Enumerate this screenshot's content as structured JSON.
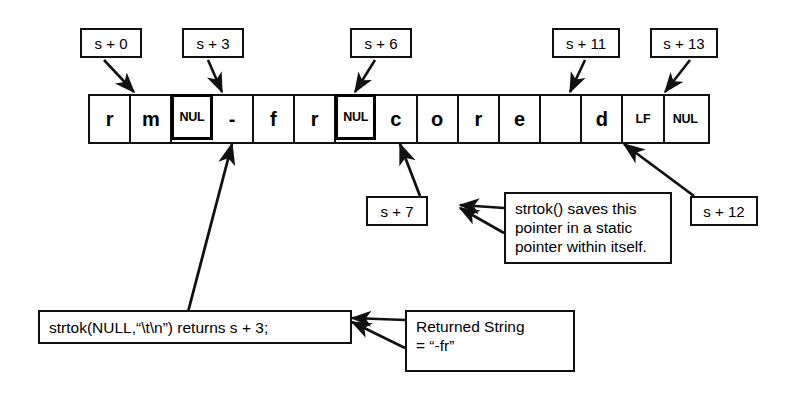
{
  "diagram": {
    "colors": {
      "ink": "#111111",
      "paper": "#ffffff"
    },
    "memory_strip": {
      "name": "character-array",
      "cells": [
        {
          "index": 0,
          "text": "r",
          "kind": "char"
        },
        {
          "index": 1,
          "text": "m",
          "kind": "char"
        },
        {
          "index": 2,
          "text": "NUL",
          "kind": "ctrl",
          "emphasis": true
        },
        {
          "index": 3,
          "text": "-",
          "kind": "char"
        },
        {
          "index": 4,
          "text": "f",
          "kind": "char"
        },
        {
          "index": 5,
          "text": "r",
          "kind": "char"
        },
        {
          "index": 6,
          "text": "NUL",
          "kind": "ctrl",
          "emphasis": true
        },
        {
          "index": 7,
          "text": "c",
          "kind": "char"
        },
        {
          "index": 8,
          "text": "o",
          "kind": "char"
        },
        {
          "index": 9,
          "text": "r",
          "kind": "char"
        },
        {
          "index": 10,
          "text": "e",
          "kind": "char"
        },
        {
          "index": 11,
          "text": "",
          "kind": "char"
        },
        {
          "index": 12,
          "text": "d",
          "kind": "char"
        },
        {
          "index": 13,
          "text": "LF",
          "kind": "ctrl"
        },
        {
          "index": 14,
          "text": "NUL",
          "kind": "ctrl"
        }
      ]
    },
    "offset_labels": {
      "s0": "s + 0",
      "s3": "s + 3",
      "s6": "s + 6",
      "s11": "s + 11",
      "s13": "s + 13",
      "s7": "s + 7",
      "s12": "s + 12"
    },
    "notes": {
      "static_pointer": {
        "line1": "strtok() saves this",
        "line2": "pointer in a static",
        "line3": "pointer within itself."
      },
      "call_result": "strtok(NULL,“\\t\\n”) returns s + 3;",
      "returned_string": {
        "line1": "Returned String",
        "line2": "= “-fr”"
      }
    }
  }
}
